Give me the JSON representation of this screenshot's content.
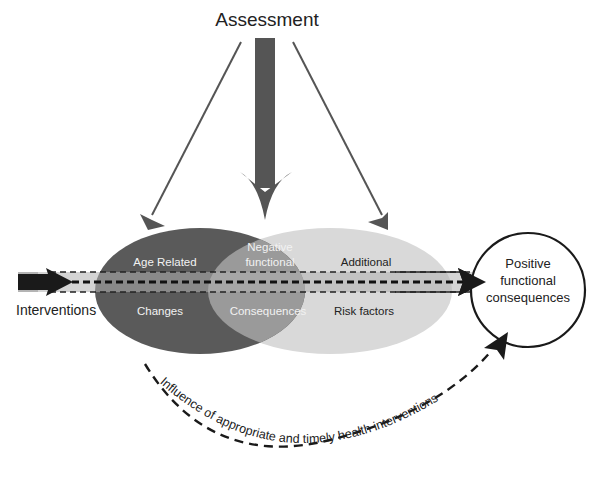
{
  "diagram": {
    "title": "Assessment",
    "ellipses": {
      "age_related": {
        "line1": "Age Related",
        "line2": "Changes",
        "color": "#5a5a5a"
      },
      "negative": {
        "line1": "Negative",
        "line2": "functional",
        "line3": "Consequences",
        "color": "#9a9a9a"
      },
      "additional": {
        "line1": "Additional",
        "line2": "Risk factors",
        "color": "#d8d8d8"
      }
    },
    "interventions_label": "Interventions",
    "outcome": {
      "line1": "Positive",
      "line2": "functional",
      "line3": "consequences"
    },
    "arc_label": "Influence of appropriate and timely health interventions",
    "colors": {
      "dark_ellipse": "#5a5a5a",
      "overlap": "#9a9a9a",
      "light_ellipse": "#d9d9d9",
      "band": "#b5b5b5",
      "arrow": "#555555",
      "text_dark": "#222222",
      "text_light": "#f2f2f2"
    }
  }
}
